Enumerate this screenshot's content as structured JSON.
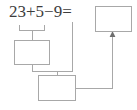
{
  "diagram": {
    "type": "math-worksheet-flow",
    "canvas": {
      "width": 137,
      "height": 110
    },
    "colors": {
      "text": "#3d3d3d",
      "stroke": "#a8a8a8",
      "background": "#ffffff"
    }
  },
  "expression": {
    "full_text": "23+5-9=",
    "tokens": [
      {
        "name": "operand-1",
        "text": "23"
      },
      {
        "name": "operator-plus",
        "text": "+"
      },
      {
        "name": "operand-2",
        "text": "5"
      },
      {
        "name": "operator-minus",
        "text": "−"
      },
      {
        "name": "operand-3",
        "text": "9"
      },
      {
        "name": "operator-equals",
        "text": "="
      }
    ]
  },
  "boxes": [
    {
      "id": "box-result",
      "label": "final-answer-box",
      "value": "",
      "placeholder": ""
    },
    {
      "id": "box-step1",
      "label": "first-step-answer-box",
      "value": "",
      "placeholder": ""
    },
    {
      "id": "box-step2",
      "label": "second-step-answer-box",
      "value": "",
      "placeholder": ""
    }
  ],
  "connectors": [
    {
      "name": "underbrace-23-plus-5",
      "from": "expression-operand-1-and-2",
      "to": "box-step1",
      "arrow": false
    },
    {
      "name": "step1-to-step2",
      "from": "box-step1",
      "to": "box-step2",
      "arrow": false
    },
    {
      "name": "operand-9-to-step2",
      "from": "expression-operand-3",
      "to": "box-step2",
      "arrow": false
    },
    {
      "name": "step2-to-result",
      "from": "box-step2",
      "to": "box-result",
      "arrow": true
    }
  ]
}
